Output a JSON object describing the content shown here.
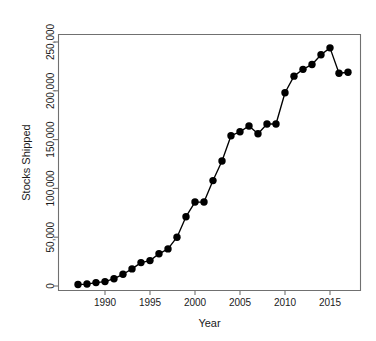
{
  "chart_data": {
    "type": "line",
    "title": "",
    "subtitle": "",
    "xlabel": "Year",
    "ylabel": "Stocks Shipped",
    "xlim": [
      1986.2,
      1986.2
    ],
    "x_ticks": [
      1990,
      1995,
      2000,
      2005,
      2010,
      2015
    ],
    "x_tick_labels": [
      "1990",
      "1995",
      "2000",
      "2005",
      "2010",
      "2015"
    ],
    "ylim": [
      0,
      260000
    ],
    "y_ticks": [
      0,
      50000,
      100000,
      150000,
      200000,
      250000
    ],
    "y_tick_labels": [
      "0",
      "50,000",
      "100,000",
      "150,000",
      "200,000",
      "250,000"
    ],
    "grid": false,
    "legend": "none",
    "marker": "filled-circle",
    "line_color": "#000000",
    "marker_color": "#000000",
    "axis_color": "#707070",
    "background_color": "#ffffff",
    "x": [
      1987,
      1988,
      1989,
      1990,
      1991,
      1992,
      1993,
      1994,
      1995,
      1996,
      1997,
      1998,
      1999,
      2000,
      2001,
      2002,
      2003,
      2004,
      2005,
      2006,
      2007,
      2008,
      2009,
      2010,
      2011,
      2012,
      2013,
      2014,
      2015,
      2016,
      2017
    ],
    "values": [
      1500,
      2000,
      3500,
      4500,
      7500,
      12000,
      17500,
      24000,
      26000,
      33000,
      38000,
      50000,
      71000,
      86000,
      86000,
      108000,
      128000,
      154000,
      158000,
      164000,
      156000,
      166000,
      166000,
      198000,
      215000,
      222000,
      227000,
      237000,
      244000,
      218000,
      219000
    ],
    "series": [
      {
        "name": "Stocks Shipped",
        "values": [
          1500,
          2000,
          3500,
          4500,
          7500,
          12000,
          17500,
          24000,
          26000,
          33000,
          38000,
          50000,
          71000,
          86000,
          86000,
          108000,
          128000,
          154000,
          158000,
          164000,
          156000,
          166000,
          166000,
          198000,
          215000,
          222000,
          227000,
          237000,
          244000,
          218000,
          219000
        ]
      }
    ],
    "annotations": []
  }
}
